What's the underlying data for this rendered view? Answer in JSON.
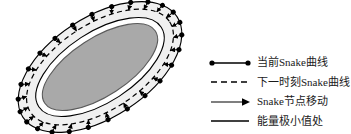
{
  "figure": {
    "background_color": "#ffffff"
  },
  "diagram": {
    "name": "snake-contour-evolution",
    "colors": {
      "current_curve": "#000000",
      "next_curve": "#000000",
      "node_dot": "#000000",
      "arrow": "#000000",
      "band_fill": "#f0f0f0",
      "inner_ring_fill": "#ffffff",
      "core_fill": "#a9a9a9",
      "core_stroke": "#555555"
    },
    "node_count": 26,
    "ellipse": {
      "center_x": 100,
      "center_y": 67,
      "rotation_deg": -33,
      "outer_rx": 92,
      "outer_ry": 50,
      "dashed_rx": 83,
      "dashed_ry": 43,
      "inner_rx": 73,
      "inner_ry": 35,
      "core_rx": 66,
      "core_ry": 29
    }
  },
  "legend": {
    "name": "figure-legend",
    "position": "right",
    "items": [
      {
        "marker": "line-with-end-dots",
        "label": "当前Snake曲线",
        "style": "solid",
        "color": "#000000"
      },
      {
        "marker": "dashed-line",
        "label": "下一时刻Snake曲线",
        "style": "dashed",
        "color": "#000000"
      },
      {
        "marker": "arrow-line",
        "label": "Snake节点移动",
        "style": "arrow",
        "color": "#000000"
      },
      {
        "marker": "thick-solid-line",
        "label": "能量极小值处",
        "style": "solid-thick",
        "color": "#000000"
      }
    ]
  },
  "chart_data": {
    "type": "diagram",
    "elements": [
      "当前Snake曲线",
      "下一时刻Snake曲线",
      "Snake节点移动",
      "能量极小值处"
    ]
  }
}
